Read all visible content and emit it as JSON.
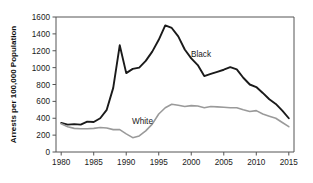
{
  "chart_data": {
    "type": "line",
    "title": "",
    "xlabel": "",
    "ylabel": "Arrests per 100,000 Population",
    "xlim": [
      1979.2,
      2015.8
    ],
    "ylim": [
      0,
      1600
    ],
    "xticks": [
      1980,
      1985,
      1990,
      1995,
      2000,
      2005,
      2010,
      2015
    ],
    "yticks": [
      0,
      200,
      400,
      600,
      800,
      1000,
      1200,
      1400,
      1600
    ],
    "grid": false,
    "legend_position": "inline-annotation",
    "annotations": [
      {
        "text": "Black",
        "x": 2001.5,
        "y": 1130
      },
      {
        "text": "White",
        "x": 1992.5,
        "y": 330
      }
    ],
    "x": [
      1980,
      1981,
      1982,
      1983,
      1984,
      1985,
      1986,
      1987,
      1988,
      1989,
      1990,
      1991,
      1992,
      1993,
      1994,
      1995,
      1996,
      1997,
      1998,
      1999,
      2000,
      2001,
      2002,
      2003,
      2004,
      2005,
      2006,
      2007,
      2008,
      2009,
      2010,
      2011,
      2012,
      2013,
      2014,
      2015
    ],
    "series": [
      {
        "name": "Black",
        "color": "#1a1a1a",
        "values": [
          345,
          325,
          330,
          325,
          360,
          355,
          400,
          500,
          760,
          1265,
          935,
          985,
          1000,
          1080,
          1190,
          1330,
          1500,
          1470,
          1370,
          1215,
          1110,
          1030,
          900,
          925,
          950,
          975,
          1005,
          980,
          880,
          800,
          770,
          700,
          625,
          570,
          490,
          400
        ]
      },
      {
        "name": "White",
        "color": "#9a9a9a",
        "values": [
          335,
          300,
          280,
          275,
          275,
          280,
          290,
          285,
          265,
          265,
          215,
          170,
          190,
          250,
          330,
          450,
          525,
          565,
          555,
          540,
          550,
          545,
          525,
          540,
          535,
          530,
          525,
          525,
          500,
          480,
          490,
          450,
          425,
          400,
          350,
          300
        ]
      }
    ]
  }
}
